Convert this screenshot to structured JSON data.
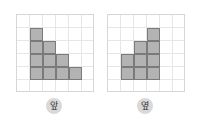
{
  "figures": [
    {
      "name": "front-view",
      "label": "앞",
      "grid": {
        "cols": 6,
        "rows": 6
      },
      "column_heights": [
        0,
        4,
        3,
        2,
        1,
        0
      ]
    },
    {
      "name": "side-view",
      "label": "옆",
      "grid": {
        "cols": 6,
        "rows": 6
      },
      "column_heights": [
        0,
        2,
        3,
        4,
        0,
        0
      ]
    }
  ],
  "colors": {
    "fill": "#b3b3b3",
    "cell_border": "#7a7a7a",
    "grid_line": "#e6e6e6"
  }
}
